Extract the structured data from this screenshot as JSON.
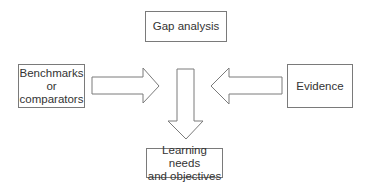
{
  "diagram": {
    "type": "flow",
    "nodes": [
      {
        "id": "gap",
        "label": "Gap analysis"
      },
      {
        "id": "benchmarks",
        "label": "Benchmarks\nor\ncomparators"
      },
      {
        "id": "evidence",
        "label": "Evidence"
      },
      {
        "id": "learning",
        "label": "Learning needs\nand objectives"
      }
    ],
    "edges": [
      {
        "from": "benchmarks",
        "to": "center",
        "direction": "right"
      },
      {
        "from": "evidence",
        "to": "center",
        "direction": "left"
      },
      {
        "from": "center",
        "to": "learning",
        "direction": "down"
      }
    ],
    "colors": {
      "stroke": "#7a7a7a",
      "text": "#333333",
      "background": "#ffffff"
    }
  }
}
